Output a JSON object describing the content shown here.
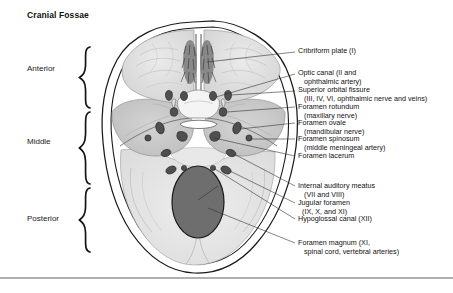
{
  "title": "Cranial Fossae",
  "fossae": [
    {
      "name": "anterior",
      "label": "Anterior"
    },
    {
      "name": "middle",
      "label": "Middle"
    },
    {
      "name": "posterior",
      "label": "Posterior"
    }
  ],
  "callouts": [
    {
      "id": "cribriform-plate",
      "text": "Cribriform plate (I)"
    },
    {
      "id": "optic-canal",
      "text": "Optic canal (II and\n   ophthalmic artery)"
    },
    {
      "id": "superior-orbital-fissure",
      "text": "Superior orbital fissure\n   (III, IV, VI, ophthalmic nerve and veins)"
    },
    {
      "id": "foramen-rotundum",
      "text": "Foramen rotundum\n   (maxillary nerve)"
    },
    {
      "id": "foramen-ovale",
      "text": "Foramen ovale\n   (mandibular nerve)"
    },
    {
      "id": "foramen-spinosum",
      "text": "Foramen spinosum\n   (middle meningeal artery)"
    },
    {
      "id": "foramen-lacerum",
      "text": "Foramen lacerum"
    },
    {
      "id": "internal-auditory-meatus",
      "text": "Internal auditory meatus\n   (VII and VIII)"
    },
    {
      "id": "jugular-foramen",
      "text": "Jugular foramen\n  (IX, X, and XI)"
    },
    {
      "id": "hypoglossal-canal",
      "text": "Hypoglossal canal (XII)"
    },
    {
      "id": "foramen-magnum",
      "text": "Foramen magnum (XI,\n   spinal cord, vertebral arteries)"
    }
  ],
  "colors": {
    "outline": "#1a1a1a",
    "anterior_fossa_fill": "#dcdcdc",
    "middle_fossa_fill": "#c8c8c8",
    "posterior_fossa_fill": "#e4e4e4",
    "foramen_fill": "#4f4f4f",
    "foramen_magnum_fill": "#6e6e6e",
    "leader_line": "#333333",
    "bottom_rule": "#b0b0b0",
    "background": "#ffffff"
  }
}
